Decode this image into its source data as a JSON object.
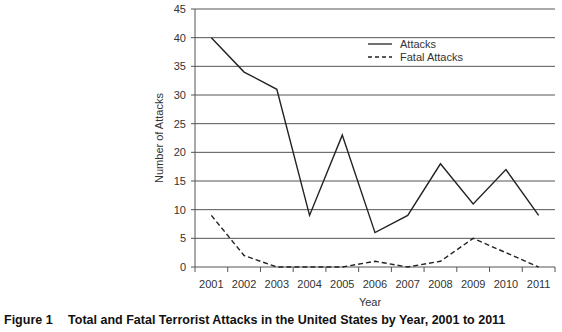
{
  "chart_data": {
    "type": "line",
    "title": "Total and Fatal Terrorist Attacks in the United States by Year, 2001 to 2011",
    "figure_label": "Figure 1",
    "xlabel": "Year",
    "ylabel": "Number of Attacks",
    "x": [
      "2001",
      "2002",
      "2003",
      "2004",
      "2005",
      "2006",
      "2007",
      "2008",
      "2009",
      "2010",
      "2011"
    ],
    "series": [
      {
        "name": "Attacks",
        "style": "solid",
        "values": [
          40,
          34,
          31,
          9,
          23,
          6,
          9,
          18,
          11,
          17,
          9
        ]
      },
      {
        "name": "Fatal Attacks",
        "style": "dashed",
        "values": [
          9,
          2,
          0,
          0,
          0,
          1,
          0,
          1,
          5,
          2.5,
          0
        ]
      }
    ],
    "ylim": [
      0,
      45
    ],
    "yticks": [
      0,
      5,
      10,
      15,
      20,
      25,
      30,
      35,
      40,
      45
    ],
    "grid": "horizontal",
    "legend_position": "upper-right-inside"
  },
  "caption": {
    "figure_label": "Figure 1",
    "text": "Total and Fatal Terrorist Attacks in the United States by Year, 2001 to 2011"
  }
}
